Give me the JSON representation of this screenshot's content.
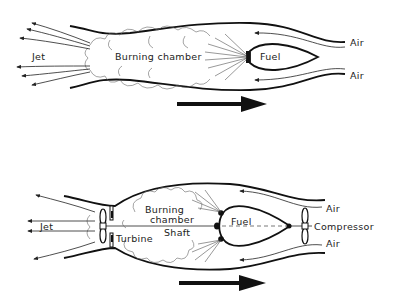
{
  "diagrams": [
    {
      "id": "ramjet",
      "labels": {
        "jet": "Jet",
        "chamber": "Burning chamber",
        "fuel": "Fuel",
        "air_top": "Air",
        "air_bottom": "Air"
      },
      "direction": "right"
    },
    {
      "id": "turbojet",
      "labels": {
        "jet": "Jet",
        "chamber_line1": "Burning",
        "chamber_line2": "chamber",
        "fuel": "Fuel",
        "shaft": "Shaft",
        "turbine": "Turbine",
        "compressor": "Compressor",
        "air_top": "Air",
        "air_bottom": "Air"
      },
      "direction": "right"
    }
  ],
  "colors": {
    "line": "#111111",
    "background": "#ffffff"
  }
}
